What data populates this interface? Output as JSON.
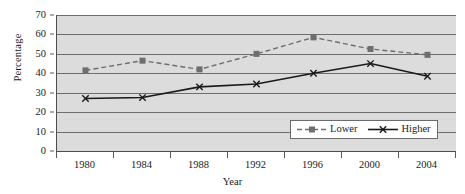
{
  "chart_data": {
    "type": "line",
    "title": "",
    "xlabel": "Year",
    "ylabel": "Percentage",
    "categories": [
      "1980",
      "1984",
      "1988",
      "1992",
      "1996",
      "2000",
      "2004"
    ],
    "x": [
      1980,
      1984,
      1988,
      1992,
      1996,
      2000,
      2004
    ],
    "series": [
      {
        "name": "Lower",
        "values": [
          41.5,
          46.5,
          42.0,
          50.0,
          58.5,
          52.5,
          49.5
        ],
        "color": "#6e6e6e",
        "line_style": "dashed",
        "marker": "square"
      },
      {
        "name": "Higher",
        "values": [
          27.0,
          27.5,
          33.0,
          34.5,
          40.0,
          45.0,
          38.5
        ],
        "color": "#1a1a1a",
        "line_style": "solid",
        "marker": "x"
      }
    ],
    "ylim": [
      0,
      70
    ],
    "ytick_step": 10,
    "yticks": [
      0,
      10,
      20,
      30,
      40,
      50,
      60,
      70
    ],
    "ytick_labels": [
      "0",
      "10",
      "20",
      "30",
      "40",
      "50",
      "60",
      "70"
    ],
    "grid": true,
    "grid_axis": "y",
    "legend_position": "bottom-right",
    "plot_background": "#dcdcdc",
    "figure_background": "#ffffff",
    "axis_color": "#4d4d4d",
    "gridline_color": "#6e6e6e"
  },
  "legend": {
    "entries": [
      {
        "label": "Lower",
        "swatch": "dashed-square-marker-swatch"
      },
      {
        "label": "Higher",
        "swatch": "solid-x-marker-swatch"
      }
    ]
  }
}
